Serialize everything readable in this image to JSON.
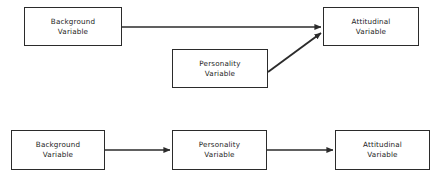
{
  "figure": {
    "background_color": "#ffffff",
    "line_color": "#2b2b2b",
    "text_color": "#1c1c1c",
    "width": 438,
    "height": 181
  },
  "diagrams": [
    {
      "id": "top-model",
      "name": "independent-effects-model",
      "nodes": [
        {
          "id": "top-background",
          "line1": "Background",
          "line2": "Variable",
          "x": 24,
          "y": 7,
          "w": 98,
          "h": 39
        },
        {
          "id": "top-personality",
          "line1": "Personality",
          "line2": "Variable",
          "x": 172,
          "y": 49,
          "w": 96,
          "h": 39
        },
        {
          "id": "top-attitudinal",
          "line1": "Attitudinal",
          "line2": "Variable",
          "x": 323,
          "y": 7,
          "w": 96,
          "h": 39
        }
      ],
      "edges": [
        {
          "id": "top-edge-background-to-attitudinal",
          "from": "top-background",
          "to": "top-attitudinal",
          "x1": 122,
          "y1": 27,
          "x2": 321,
          "y2": 27,
          "kind": "horizontal-arrow"
        },
        {
          "id": "top-edge-personality-to-attitudinal",
          "from": "top-personality",
          "to": "top-attitudinal",
          "x1": 268,
          "y1": 72,
          "x2": 321,
          "y2": 33,
          "kind": "diagonal-arrow"
        }
      ]
    },
    {
      "id": "bottom-model",
      "name": "mediated-chain-model",
      "nodes": [
        {
          "id": "bottom-background",
          "line1": "Background",
          "line2": "Variable",
          "x": 11,
          "y": 130,
          "w": 94,
          "h": 40
        },
        {
          "id": "bottom-personality",
          "line1": "Personality",
          "line2": "Variable",
          "x": 172,
          "y": 130,
          "w": 95,
          "h": 40
        },
        {
          "id": "bottom-attitudinal",
          "line1": "Attitudinal",
          "line2": "Variable",
          "x": 335,
          "y": 130,
          "w": 95,
          "h": 40
        }
      ],
      "edges": [
        {
          "id": "bottom-edge-background-to-personality",
          "from": "bottom-background",
          "to": "bottom-personality",
          "x1": 105,
          "y1": 150,
          "x2": 170,
          "y2": 150,
          "kind": "horizontal-arrow"
        },
        {
          "id": "bottom-edge-personality-to-attitudinal",
          "from": "bottom-personality",
          "to": "bottom-attitudinal",
          "x1": 267,
          "y1": 150,
          "x2": 333,
          "y2": 150,
          "kind": "horizontal-arrow"
        }
      ]
    }
  ]
}
